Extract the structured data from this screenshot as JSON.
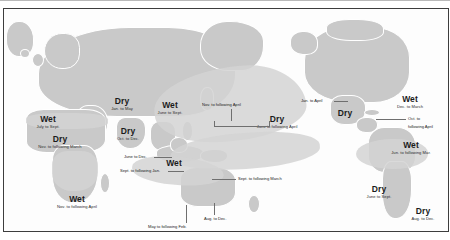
{
  "figure": {
    "kind": "world-map",
    "projection_note": "world map, oceans white, land light grey",
    "colors": {
      "land": "#c9c9c9",
      "ocean": "#fdfdfd",
      "band": "#d4d4d4",
      "frame": "#3d3d3d",
      "text": "#1b1b1b",
      "leader": "#6f6f6f"
    }
  },
  "season_labels": [
    {
      "id": "africa-north",
      "keyword": "Wet",
      "period": "July to Sept."
    },
    {
      "id": "africa-central",
      "keyword": "Dry",
      "period": "Nov. to following March"
    },
    {
      "id": "africa-south",
      "keyword": "Wet",
      "period": "Nov. to following April"
    },
    {
      "id": "central-asia",
      "keyword": "Dry",
      "period": "Jan. to May"
    },
    {
      "id": "east-asia",
      "keyword": "Wet",
      "period": "June to Sept."
    },
    {
      "id": "india",
      "keyword": "Dry",
      "period": "Oct. to Dec."
    },
    {
      "id": "maritime-asia",
      "keyword": "Wet",
      "period": ""
    },
    {
      "id": "pacific",
      "keyword": "Dry",
      "period": "June to following April"
    },
    {
      "id": "north-america-west",
      "keyword": "Dry",
      "period": ""
    },
    {
      "id": "north-america-east",
      "keyword": "Wet",
      "period": "Dec. to March"
    },
    {
      "id": "caribbean",
      "keyword": "Wet",
      "period": "Jun. to following Mar."
    },
    {
      "id": "south-america-west",
      "keyword": "Dry",
      "period": "June to Sept."
    },
    {
      "id": "south-america-east",
      "keyword": "Dry",
      "period": "Aug. to Dec."
    }
  ],
  "annotations": [
    {
      "id": "anno-north-pacific",
      "text": "Nov. to following April"
    },
    {
      "id": "anno-east-pacific",
      "text": "Jan. to April"
    },
    {
      "id": "anno-gulf",
      "text": "Oct. to"
    },
    {
      "id": "anno-gulf-2",
      "text": "following April"
    },
    {
      "id": "anno-indian-1",
      "text": "June to Dec."
    },
    {
      "id": "anno-indian-2",
      "text": "Sept. to following Jan."
    },
    {
      "id": "anno-south-indian",
      "text": "Sept. to following March"
    },
    {
      "id": "anno-australia",
      "text": "Aug. to Dec."
    },
    {
      "id": "anno-java",
      "text": "May to following Feb."
    }
  ]
}
